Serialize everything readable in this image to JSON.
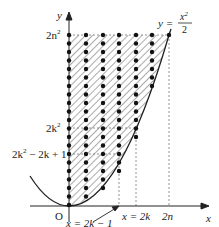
{
  "diagram": {
    "axes": {
      "x_label": "x",
      "y_label": "y",
      "origin_label": "O"
    },
    "curve": {
      "label_lhs": "y =",
      "label_num": "x",
      "label_num_exp": "2",
      "label_den": "2"
    },
    "y_ticks": {
      "top": "2n",
      "top_exp": "2",
      "mid": "2k",
      "mid_exp": "2",
      "low_a": "2k",
      "low_exp": "2",
      "low_b": " − 2k + 1"
    },
    "x_ticks": {
      "a": "x = 2k",
      "b": "2n",
      "pointer": "x = 2k − 1"
    },
    "colors": {
      "ink": "#222222",
      "hatch": "#555555",
      "dash": "#777777"
    }
  }
}
